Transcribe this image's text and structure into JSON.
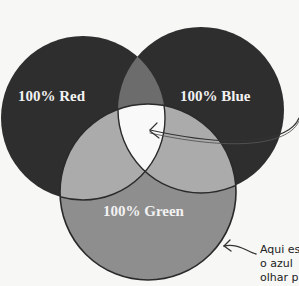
{
  "diagram": {
    "type": "venn",
    "title": "",
    "circles": [
      {
        "id": "red",
        "label": "100% Red",
        "cx": 83,
        "cy": 118,
        "r": 82
      },
      {
        "id": "blue",
        "label": "100% Blue",
        "cx": 201,
        "cy": 110,
        "r": 83
      },
      {
        "id": "green",
        "label": "100% Green",
        "cx": 148,
        "cy": 192,
        "r": 88
      }
    ],
    "labels": {
      "red": "100% Red",
      "blue": "100% Blue",
      "green": "100% Green"
    },
    "annotation": {
      "lines": [
        "Aqui es",
        "o azul",
        "olhar p"
      ]
    },
    "colors": {
      "background": "#f7f7f5",
      "single_red_blue": "#2e2e2e",
      "red_blue_overlap": "#6c6c6c",
      "green_single": "#8e8e8e",
      "green_overlap": "#ababab",
      "center_white": "#f9f9f9",
      "outline": "#2a2a2a"
    }
  }
}
